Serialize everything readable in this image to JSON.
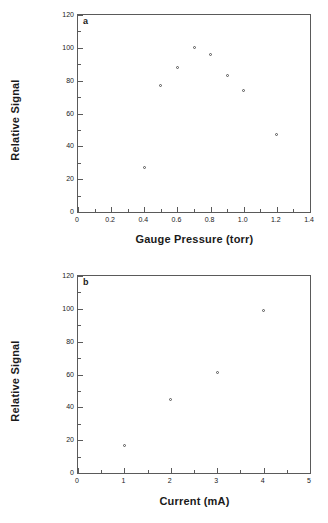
{
  "figure": {
    "panels": [
      {
        "id": "a",
        "label": "a",
        "ylabel": "Relative Signal",
        "xlabel": "Gauge Pressure (torr)"
      },
      {
        "id": "b",
        "label": "b",
        "ylabel": "Relative Signal",
        "xlabel": "Current (mA)"
      }
    ]
  },
  "chart_data": [
    {
      "type": "scatter",
      "panel": "a",
      "title": "",
      "xlabel": "Gauge Pressure (torr)",
      "ylabel": "Relative Signal",
      "xlim": [
        0,
        1.4
      ],
      "ylim": [
        0,
        120
      ],
      "xticks": [
        0,
        0.2,
        0.4,
        0.6,
        0.8,
        1.0,
        1.2,
        1.4
      ],
      "xtick_labels": [
        "0",
        "0.2",
        "0.4",
        "0.6",
        "0.8",
        "1.0",
        "1.2",
        "1.4"
      ],
      "xminor_step": 0.1,
      "yticks": [
        0,
        20,
        40,
        60,
        80,
        100,
        120
      ],
      "ytick_labels": [
        "0",
        "20",
        "40",
        "60",
        "80",
        "100",
        "120"
      ],
      "yminor_step": 10,
      "grid": false,
      "legend": null,
      "marker": "open-circle",
      "x": [
        0.4,
        0.5,
        0.6,
        0.7,
        0.8,
        0.9,
        1.0,
        1.2
      ],
      "y": [
        27,
        77,
        88,
        100,
        96,
        83,
        74,
        47
      ]
    },
    {
      "type": "scatter",
      "panel": "b",
      "title": "",
      "xlabel": "Current (mA)",
      "ylabel": "Relative Signal",
      "xlim": [
        0,
        5
      ],
      "ylim": [
        0,
        120
      ],
      "xticks": [
        0,
        1,
        2,
        3,
        4,
        5
      ],
      "xtick_labels": [
        "0",
        "1",
        "2",
        "3",
        "4",
        "5"
      ],
      "xminor_step": 0.5,
      "yticks": [
        0,
        20,
        40,
        60,
        80,
        100,
        120
      ],
      "ytick_labels": [
        "0",
        "20",
        "40",
        "60",
        "80",
        "100",
        "120"
      ],
      "yminor_step": 10,
      "grid": false,
      "legend": null,
      "marker": "open-circle",
      "x": [
        1,
        2,
        3,
        4
      ],
      "y": [
        16.5,
        44.5,
        61,
        99
      ]
    }
  ],
  "colors": {
    "axis": "#5a5a5a",
    "marker_edge": "#555555",
    "marker_fill": "#ffffff",
    "text": "#1a1a1a",
    "background": "#ffffff"
  }
}
